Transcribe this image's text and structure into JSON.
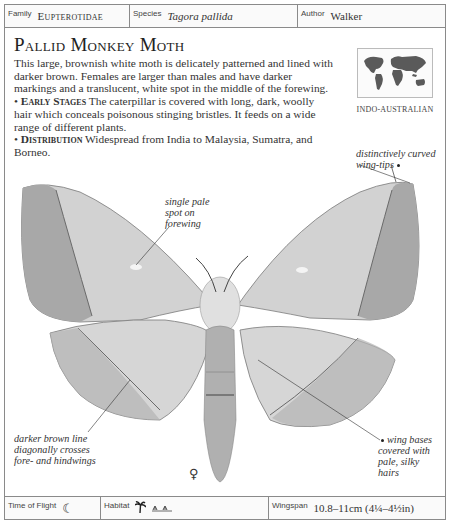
{
  "header": {
    "family_label": "Family",
    "family_value": "Eupterotidae",
    "species_label": "Species",
    "species_value": "Tagora pallida",
    "author_label": "Author",
    "author_value": "Walker"
  },
  "title": "Pallid Monkey Moth",
  "description": "This large, brownish white moth is delicately patterned and lined with darker brown. Females are larger than males and have darker markings and a translucent, white spot in the middle of the forewing.",
  "early_stages": {
    "heading": "Early Stages",
    "text": "The caterpillar is covered with long, dark, woolly hair which conceals poisonous stinging bristles. It feeds on a wide range of different plants."
  },
  "distribution": {
    "heading": "Distribution",
    "text": "Widespread from India to Malaysia, Sumatra, and Borneo."
  },
  "map": {
    "region_label": "INDO-AUSTRALIAN",
    "icon": "world-map-icon"
  },
  "annotations": {
    "wing_tips": "distinctively curved wing-tips",
    "pale_spot": "single pale spot on forewing",
    "brown_line": "darker brown line diagonally crosses fore- and hindwings",
    "wing_bases": "wing bases covered with pale, silky hairs"
  },
  "sex_symbol": "♀",
  "footer": {
    "flight_label": "Time of Flight",
    "flight_icon": "☾",
    "habitat_label": "Habitat",
    "habitat_icons": [
      "palm-tree-icon",
      "grassland-icon"
    ],
    "habitat_glyphs": [
      "🌴",
      "ᨓᨓ"
    ],
    "wingspan_label": "Wingspan",
    "wingspan_value": "10.8–11cm (4¼–4½in)"
  }
}
